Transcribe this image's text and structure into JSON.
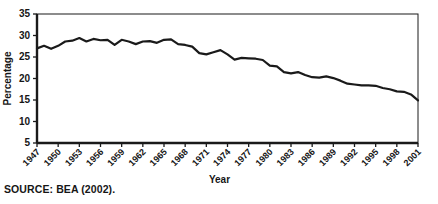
{
  "figure": {
    "source_note": "SOURCE: BEA (2002).",
    "line_color": "#1a1a1a",
    "frame_color": "#1a1a1a",
    "background": "#ffffff"
  },
  "chart_data": {
    "type": "line",
    "title": "",
    "xlabel": "Year",
    "ylabel": "Percentage",
    "xlim": [
      1947,
      2001
    ],
    "ylim": [
      5,
      35
    ],
    "grid": false,
    "legend": null,
    "ytick_labels": [
      "5",
      "10",
      "15",
      "20",
      "25",
      "30",
      "35"
    ],
    "yticks": [
      5,
      10,
      15,
      20,
      25,
      30,
      35
    ],
    "xtick_labels": [
      "1947",
      "1950",
      "1953",
      "1956",
      "1959",
      "1962",
      "1965",
      "1968",
      "1971",
      "1974",
      "1977",
      "1980",
      "1983",
      "1986",
      "1989",
      "1992",
      "1995",
      "1998",
      "2001"
    ],
    "xticks": [
      1947,
      1950,
      1953,
      1956,
      1959,
      1962,
      1965,
      1968,
      1971,
      1974,
      1977,
      1980,
      1983,
      1986,
      1989,
      1992,
      1995,
      1998,
      2001
    ],
    "x": [
      1947,
      1948,
      1949,
      1950,
      1951,
      1952,
      1953,
      1954,
      1955,
      1956,
      1957,
      1958,
      1959,
      1960,
      1961,
      1962,
      1963,
      1964,
      1965,
      1966,
      1967,
      1968,
      1969,
      1970,
      1971,
      1972,
      1973,
      1974,
      1975,
      1976,
      1977,
      1978,
      1979,
      1980,
      1981,
      1982,
      1983,
      1984,
      1985,
      1986,
      1987,
      1988,
      1989,
      1990,
      1991,
      1992,
      1993,
      1994,
      1995,
      1996,
      1997,
      1998,
      1999,
      2000,
      2001
    ],
    "series": [
      {
        "name": "Manufacturing share of GDP",
        "values": [
          27.0,
          27.6,
          26.9,
          27.6,
          28.6,
          28.8,
          29.4,
          28.6,
          29.2,
          28.9,
          29.0,
          27.8,
          29.0,
          28.6,
          28.0,
          28.6,
          28.7,
          28.3,
          29.0,
          29.1,
          28.0,
          27.8,
          27.4,
          25.9,
          25.6,
          26.1,
          26.6,
          25.6,
          24.4,
          24.8,
          24.7,
          24.6,
          24.3,
          23.0,
          22.8,
          21.5,
          21.2,
          21.5,
          20.8,
          20.3,
          20.2,
          20.5,
          20.1,
          19.5,
          18.8,
          18.6,
          18.4,
          18.4,
          18.3,
          17.8,
          17.5,
          17.0,
          16.9,
          16.3,
          14.9
        ]
      }
    ]
  }
}
